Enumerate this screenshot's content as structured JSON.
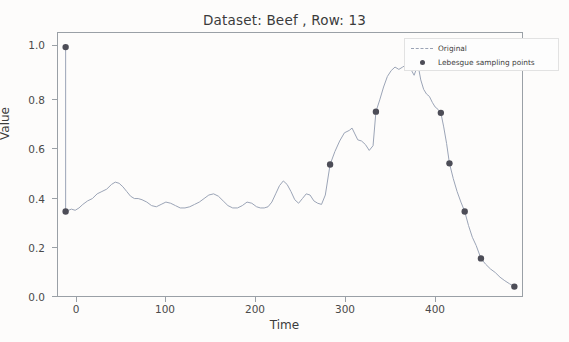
{
  "figure": {
    "title": "Dataset: Beef , Row: 13",
    "xlabel": "Time",
    "ylabel": "Value",
    "background_color": "#fdfcfb",
    "frame_color": "#9aa0a6"
  },
  "legend": {
    "entries": [
      {
        "label": "Original",
        "key": "dashed-line",
        "color": "#9aa3b5"
      },
      {
        "label": "Lebesgue sampling points",
        "key": "marker-dot",
        "color": "#4d4d57"
      }
    ]
  },
  "axes": {
    "y_ticks": [
      "0.0",
      "0.2",
      "0.4",
      "0.6",
      "0.8",
      "1.0"
    ],
    "x_ticks": [
      "0",
      "100",
      "200",
      "300",
      "400"
    ]
  },
  "chart_data": {
    "type": "line",
    "title": "Dataset: Beef , Row: 13",
    "xlabel": "Time",
    "ylabel": "Value",
    "xlim": [
      -8,
      478
    ],
    "ylim": [
      -0.06,
      1.06
    ],
    "grid": false,
    "legend_position": "upper right",
    "series": [
      {
        "name": "Original",
        "style": "dashed-thin-line",
        "color": "#9aa3b5",
        "x": [
          0,
          0,
          3,
          6,
          10,
          14,
          18,
          23,
          28,
          33,
          38,
          43,
          48,
          52,
          56,
          60,
          64,
          68,
          72,
          76,
          80,
          85,
          90,
          95,
          100,
          105,
          110,
          115,
          120,
          125,
          130,
          135,
          140,
          145,
          150,
          155,
          160,
          165,
          170,
          175,
          180,
          185,
          190,
          195,
          200,
          204,
          208,
          212,
          216,
          220,
          224,
          228,
          232,
          236,
          240,
          244,
          248,
          252,
          256,
          260,
          264,
          268,
          272,
          277,
          282,
          287,
          292,
          297,
          300,
          303,
          306,
          310,
          314,
          318,
          322,
          325,
          329,
          333,
          337,
          341,
          345,
          349,
          353,
          357,
          361,
          365,
          369,
          372,
          375,
          378,
          381,
          384,
          387,
          390,
          393,
          396,
          399,
          402,
          406,
          410,
          414,
          418,
          422,
          426,
          430,
          435,
          440,
          445,
          450,
          455,
          460,
          465,
          470
        ],
        "y": [
          1.0,
          0.3,
          0.305,
          0.31,
          0.305,
          0.315,
          0.33,
          0.345,
          0.355,
          0.375,
          0.385,
          0.395,
          0.415,
          0.425,
          0.42,
          0.405,
          0.385,
          0.365,
          0.355,
          0.355,
          0.35,
          0.34,
          0.325,
          0.32,
          0.33,
          0.34,
          0.335,
          0.325,
          0.315,
          0.315,
          0.32,
          0.33,
          0.34,
          0.355,
          0.37,
          0.375,
          0.365,
          0.345,
          0.325,
          0.315,
          0.315,
          0.325,
          0.34,
          0.335,
          0.32,
          0.315,
          0.315,
          0.32,
          0.34,
          0.375,
          0.41,
          0.43,
          0.415,
          0.385,
          0.35,
          0.335,
          0.355,
          0.375,
          0.37,
          0.345,
          0.335,
          0.33,
          0.37,
          0.5,
          0.555,
          0.6,
          0.635,
          0.645,
          0.655,
          0.63,
          0.605,
          0.6,
          0.585,
          0.56,
          0.58,
          0.725,
          0.775,
          0.83,
          0.875,
          0.9,
          0.915,
          0.905,
          0.915,
          0.925,
          0.91,
          0.88,
          0.925,
          0.86,
          0.82,
          0.8,
          0.79,
          0.765,
          0.745,
          0.735,
          0.72,
          0.66,
          0.59,
          0.505,
          0.44,
          0.385,
          0.34,
          0.3,
          0.24,
          0.19,
          0.155,
          0.1,
          0.075,
          0.055,
          0.04,
          0.02,
          0.005,
          -0.008,
          -0.02
        ]
      },
      {
        "name": "Lebesgue sampling points",
        "style": "scatter-dots",
        "color": "#4d4d57",
        "x": [
          0,
          0,
          277,
          325,
          369,
          393,
          402,
          418,
          435,
          470
        ],
        "y": [
          1.0,
          0.3,
          0.5,
          0.725,
          0.925,
          0.72,
          0.505,
          0.3,
          0.1,
          -0.02
        ]
      }
    ]
  }
}
